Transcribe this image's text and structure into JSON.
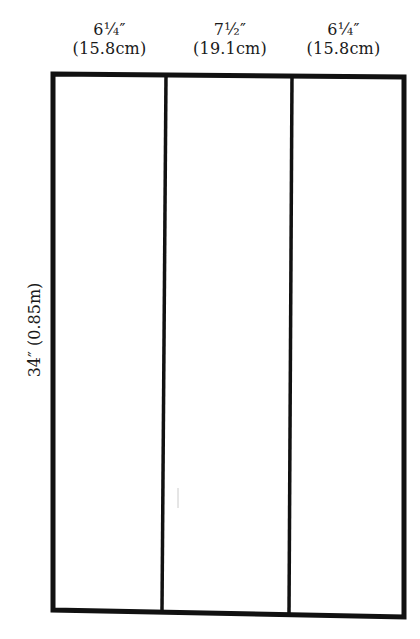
{
  "diagram": {
    "type": "cutting-pattern",
    "columns": [
      {
        "imperial": "6¼″",
        "metric": "(15.8cm)"
      },
      {
        "imperial": "7½″",
        "metric": "(19.1cm)"
      },
      {
        "imperial": "6¼″",
        "metric": "(15.8cm)"
      }
    ],
    "height_label": "34″ (0.85m)",
    "stroke_color": "#111111",
    "background_color": "#ffffff"
  }
}
